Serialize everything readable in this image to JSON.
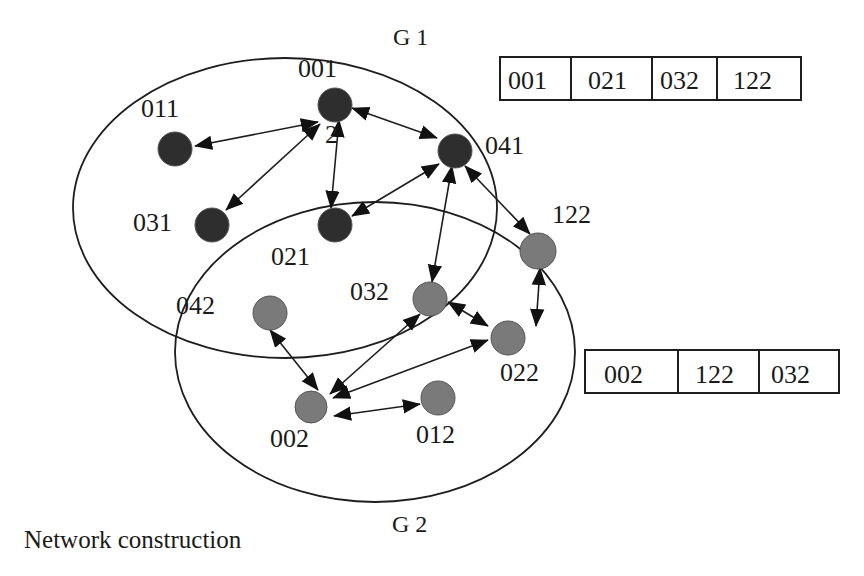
{
  "caption": "Network construction",
  "groups": [
    {
      "id": "G1",
      "label": "G 1"
    },
    {
      "id": "G2",
      "label": "G 2"
    }
  ],
  "nodes": [
    {
      "id": "001",
      "label": "001",
      "group": "G1",
      "shade": "dark"
    },
    {
      "id": "011",
      "label": "011",
      "group": "G1",
      "shade": "dark"
    },
    {
      "id": "041",
      "label": "041",
      "group": "G1",
      "shade": "dark"
    },
    {
      "id": "031",
      "label": "031",
      "group": "G1",
      "shade": "dark"
    },
    {
      "id": "021",
      "label": "021",
      "group": "G1",
      "shade": "dark"
    },
    {
      "id": "122",
      "label": "122",
      "group": "G2",
      "shade": "gray"
    },
    {
      "id": "032",
      "label": "032",
      "group": "G2",
      "shade": "gray"
    },
    {
      "id": "042",
      "label": "042",
      "group": "G2",
      "shade": "gray"
    },
    {
      "id": "022",
      "label": "022",
      "group": "G2",
      "shade": "gray"
    },
    {
      "id": "002",
      "label": "002",
      "group": "G2",
      "shade": "gray"
    },
    {
      "id": "012",
      "label": "012",
      "group": "G2",
      "shade": "gray"
    }
  ],
  "stray_label": "2",
  "edges": [
    {
      "from": "001",
      "to": "011",
      "bidirectional": true
    },
    {
      "from": "001",
      "to": "031",
      "bidirectional": true
    },
    {
      "from": "001",
      "to": "021",
      "bidirectional": true
    },
    {
      "from": "001",
      "to": "041",
      "bidirectional": true
    },
    {
      "from": "041",
      "to": "021",
      "bidirectional": true
    },
    {
      "from": "041",
      "to": "032",
      "bidirectional": true
    },
    {
      "from": "041",
      "to": "122",
      "bidirectional": true
    },
    {
      "from": "122",
      "to": "022",
      "bidirectional": true
    },
    {
      "from": "032",
      "to": "022",
      "bidirectional": true
    },
    {
      "from": "032",
      "to": "002",
      "bidirectional": true
    },
    {
      "from": "022",
      "to": "002",
      "bidirectional": true
    },
    {
      "from": "042",
      "to": "002",
      "bidirectional": true
    },
    {
      "from": "002",
      "to": "012",
      "bidirectional": true
    }
  ],
  "tables": [
    {
      "id": "g1-table",
      "group": "G1",
      "cells": [
        "001",
        "021",
        "032",
        "122"
      ]
    },
    {
      "id": "g2-table",
      "group": "G2",
      "cells": [
        "002",
        "122",
        "032"
      ]
    }
  ],
  "colors": {
    "dark_node": "#2e2e2e",
    "gray_node": "#7a7a7a",
    "stroke": "#1e1e1e",
    "background": "#ffffff"
  }
}
